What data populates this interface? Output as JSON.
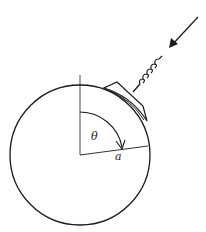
{
  "diagram": {
    "labels": {
      "angle": "θ",
      "radius": "a"
    },
    "colors": {
      "stroke": "#1a1a1a",
      "background": "#ffffff"
    },
    "geometry": {
      "circle_center": [
        80,
        155
      ],
      "circle_radius": 70
    }
  }
}
